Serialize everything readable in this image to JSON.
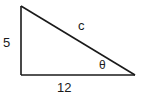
{
  "diagram": {
    "type": "right-triangle",
    "vertices": {
      "top_left": [
        21,
        6
      ],
      "bottom_left": [
        21,
        75
      ],
      "bottom_right": [
        135,
        75
      ]
    },
    "labels": {
      "left_side": "5",
      "hypotenuse": "c",
      "angle": "θ",
      "bottom_side": "12"
    },
    "colors": {
      "stroke": "#1a1a1a",
      "background": "#ffffff"
    }
  }
}
